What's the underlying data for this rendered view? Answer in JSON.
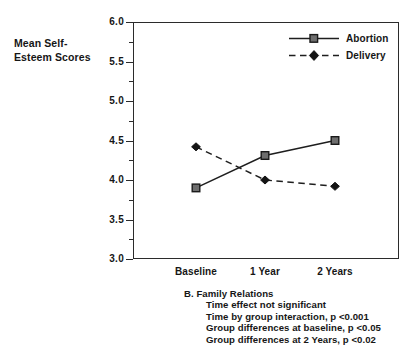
{
  "chart_data": {
    "type": "line",
    "title": "",
    "xlabel": "",
    "ylabel": "Mean Self-Esteem Scores",
    "ylabel_lines": [
      "Mean Self-",
      "Esteem Scores"
    ],
    "categories": [
      "Baseline",
      "1 Year",
      "2 Years"
    ],
    "ylim": [
      3.0,
      6.0
    ],
    "ytick_labels": [
      "3.0",
      "3.5",
      "4.0",
      "4.5",
      "5.0",
      "5.5",
      "6.0"
    ],
    "ytick_values": [
      3.0,
      3.5,
      4.0,
      4.5,
      5.0,
      5.5,
      6.0
    ],
    "yminor_values": [
      3.25,
      3.75,
      4.25,
      4.75,
      5.25,
      5.75
    ],
    "grid": false,
    "legend_position": "top-right-inside",
    "series": [
      {
        "name": "Abortion",
        "values": [
          3.9,
          4.31,
          4.5
        ],
        "line_style": "solid",
        "marker": "open-square",
        "color": "#1e1e1e"
      },
      {
        "name": "Delivery",
        "values": [
          4.42,
          4.0,
          3.92
        ],
        "line_style": "dashed",
        "marker": "filled-diamond",
        "color": "#1e1e1e"
      }
    ],
    "annotations": [
      "B.  Family Relations",
      "Time effect not significant",
      "Time by group interaction, p <0.001",
      "Group differences at baseline, p <0.05",
      "Group differences at 2 Years, p <0.02"
    ]
  },
  "caption": {
    "heading": "B.  Family Relations",
    "lines": [
      "Time effect not significant",
      "Time by group interaction, p <0.001",
      "Group differences at baseline, p <0.05",
      "Group differences at 2 Years, p <0.02"
    ]
  },
  "legend": {
    "items": [
      {
        "label": "Abortion",
        "marker": "open-square",
        "line": "solid"
      },
      {
        "label": "Delivery",
        "marker": "filled-diamond",
        "line": "dashed"
      }
    ]
  },
  "colors": {
    "ink": "#1e1e1e",
    "axis": "#2b2b2b",
    "marker_fill": "#6e6e6e",
    "background": "#ffffff"
  }
}
